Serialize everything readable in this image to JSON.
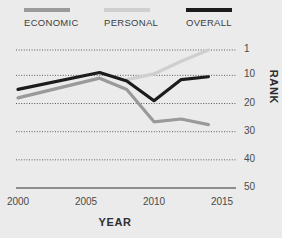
{
  "legend": {
    "items": [
      {
        "label": "ECONOMIC",
        "color": "#9a9a9a",
        "key": "economic"
      },
      {
        "label": "PERSONAL",
        "color": "#cfcfcf",
        "key": "personal"
      },
      {
        "label": "OVERALL",
        "color": "#1c1c1c",
        "key": "overall"
      }
    ]
  },
  "axes": {
    "y_title": "RANK",
    "x_title": "YEAR",
    "y_ticks": [
      "1",
      "10",
      "20",
      "30",
      "40",
      "50"
    ],
    "x_ticks": [
      "2000",
      "2005",
      "2010",
      "2015"
    ]
  },
  "chart_data": {
    "type": "line",
    "title": "",
    "subtitle": "",
    "xlabel": "YEAR",
    "ylabel": "RANK",
    "xlim": [
      2000,
      2015
    ],
    "ylim": [
      1,
      50
    ],
    "y_inverted": true,
    "grid": true,
    "grid_style": "dotted-horizontal",
    "legend_position": "top",
    "yticks": [
      1,
      10,
      20,
      30,
      40,
      50
    ],
    "xticks": [
      2000,
      2005,
      2010,
      2015
    ],
    "series": [
      {
        "name": "ECONOMIC",
        "color": "#9a9a9a",
        "x": [
          2000,
          2006,
          2008,
          2010,
          2012,
          2014
        ],
        "values": [
          18,
          11,
          15,
          26.5,
          25.5,
          27.5
        ]
      },
      {
        "name": "PERSONAL",
        "color": "#cfcfcf",
        "x": [
          2008,
          2010,
          2012,
          2014
        ],
        "values": [
          11.5,
          9.5,
          5,
          1
        ]
      },
      {
        "name": "OVERALL",
        "color": "#1c1c1c",
        "x": [
          2000,
          2006,
          2008,
          2010,
          2012,
          2014
        ],
        "values": [
          15,
          9,
          12,
          19,
          11.5,
          10.5
        ]
      }
    ]
  },
  "style": {
    "background": "#ebebeb",
    "grid_color": "#5a5a5a",
    "axis_color": "#6e6e6e",
    "text_color": "#3d3d3d"
  }
}
